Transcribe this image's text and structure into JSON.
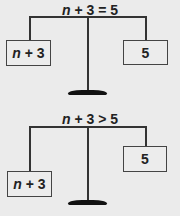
{
  "scales": [
    {
      "title_var": "n",
      "title_rest": " + 3 = 5",
      "left_box": {
        "var": "n",
        "rest": " + 3"
      },
      "right_box": {
        "value": "5"
      },
      "state": "balanced"
    },
    {
      "title_var": "n",
      "title_rest": " + 3 > 5",
      "left_box": {
        "var": "n",
        "rest": " + 3"
      },
      "right_box": {
        "value": "5"
      },
      "state": "left-heavier"
    }
  ]
}
